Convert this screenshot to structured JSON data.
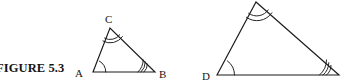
{
  "figure": {
    "caption": "FIGURE 5.3",
    "caption_clipped_left": true,
    "background_color": "#ffffff",
    "ink_color": "#1b1b1b"
  },
  "triangles": [
    {
      "name": "triangle-abc",
      "position": "left",
      "vertices": [
        {
          "label": "A",
          "x": 93,
          "y": 72,
          "label_x": 75,
          "label_y": 77,
          "arc_count": 1
        },
        {
          "label": "B",
          "x": 155,
          "y": 72,
          "label_x": 159,
          "label_y": 78,
          "arc_count": 3
        },
        {
          "label": "C",
          "x": 110,
          "y": 28,
          "label_x": 105,
          "label_y": 23,
          "arc_count": 2
        }
      ]
    },
    {
      "name": "triangle-def",
      "position": "right",
      "apex_clipped_top": true,
      "vertices": [
        {
          "label": "D",
          "x": 217,
          "y": 75,
          "label_x": 202,
          "label_y": 80,
          "arc_count": 1
        },
        {
          "label": "",
          "x": 339,
          "y": 75,
          "label_x": 0,
          "label_y": 0,
          "arc_count": 3
        },
        {
          "label": "",
          "x": 256,
          "y": 2,
          "label_x": 0,
          "label_y": 0,
          "arc_count": 2
        }
      ]
    }
  ]
}
